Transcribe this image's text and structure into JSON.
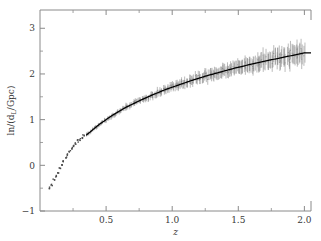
{
  "figure": {
    "background": "#ffffff",
    "frame_color": "#8a8a8a",
    "data_color": "#4a4a4a",
    "line_color": "#000000"
  },
  "chart_data": {
    "type": "scatter",
    "title": "",
    "xlabel": "z",
    "ylabel": "ln/(dₗ/Gpc)",
    "ylabel_parts": {
      "prefix": "ln/(d",
      "sub": "L",
      "suffix": "/Gpc)"
    },
    "xlim": [
      0.0,
      2.05
    ],
    "ylim": [
      -1.0,
      3.4
    ],
    "grid": false,
    "legend": null,
    "xticks": [
      0.5,
      1.0,
      1.5,
      2.0
    ],
    "xticklabels": [
      "0.5",
      "1.0",
      "1.5",
      "2.0"
    ],
    "xminorticks": [
      0.25,
      0.75,
      1.25,
      1.75
    ],
    "yticks": [
      -1,
      0,
      1,
      2,
      3
    ],
    "yticklabels": [
      "−1",
      "0",
      "1",
      "2",
      "3"
    ],
    "yminorticks": [
      -0.5,
      0.5,
      1.5,
      2.5
    ],
    "series": [
      {
        "name": "model",
        "type": "line",
        "color": "#000000",
        "x": [
          0.35,
          0.45,
          0.55,
          0.65,
          0.75,
          0.85,
          0.95,
          1.05,
          1.15,
          1.25,
          1.35,
          1.45,
          1.55,
          1.65,
          1.75,
          1.85,
          1.95,
          2.0
        ],
        "y": [
          0.66,
          0.9,
          1.1,
          1.27,
          1.41,
          1.54,
          1.66,
          1.76,
          1.86,
          1.95,
          2.03,
          2.11,
          2.18,
          2.25,
          2.31,
          2.37,
          2.43,
          2.46
        ]
      },
      {
        "name": "low-z-points",
        "type": "scatter",
        "color": "#4a4a4a",
        "x": [
          0.075,
          0.09,
          0.105,
          0.12,
          0.135,
          0.15,
          0.165,
          0.18,
          0.195,
          0.21,
          0.225,
          0.24,
          0.255,
          0.27,
          0.285,
          0.3,
          0.315,
          0.33
        ],
        "y": [
          -0.5,
          -0.44,
          -0.33,
          -0.24,
          -0.15,
          -0.06,
          0.02,
          0.1,
          0.17,
          0.24,
          0.31,
          0.37,
          0.43,
          0.48,
          0.53,
          0.57,
          0.61,
          0.64
        ]
      },
      {
        "name": "supernova-errorbars",
        "type": "errorbar",
        "color": "#555555",
        "x_start": 0.35,
        "x_end": 2.0,
        "err_start": 0.04,
        "err_end": 0.22,
        "scatter_start": 0.02,
        "scatter_end": 0.1,
        "n_points": 260
      }
    ]
  }
}
